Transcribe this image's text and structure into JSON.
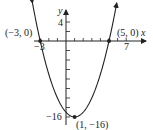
{
  "chart_data": {
    "type": "line",
    "title": "",
    "function": "y = (x + 3)(x - 5) = x^2 - 2x - 15... graph of parabola with vertex (1, -16)",
    "xlabel": "x",
    "ylabel": "y",
    "xlim": [
      -3.5,
      8
    ],
    "ylim": [
      -17.5,
      6
    ],
    "x_ticks_labeled": [
      -3,
      7
    ],
    "y_ticks_labeled": [
      4,
      -16
    ],
    "x_tick_step": 1,
    "y_tick_step": 2,
    "points": [
      {
        "label": "(-3, 0)",
        "x": -3,
        "y": 0
      },
      {
        "label": "(5, 0)",
        "x": 5,
        "y": 0
      },
      {
        "label": "(1, -16)",
        "x": 1,
        "y": -16
      }
    ],
    "series": [
      {
        "name": "parabola",
        "x": [
          -3.9,
          -3,
          -2,
          -1,
          0,
          1,
          2,
          3,
          4,
          5,
          5.9
        ],
        "y": [
          7.2,
          0,
          -7,
          -12,
          -15,
          -16,
          -15,
          -12,
          -7,
          0,
          7.2
        ]
      }
    ],
    "grid": false,
    "legend": null
  },
  "labels": {
    "x_axis": "x",
    "y_axis": "y",
    "tick_neg3": "−3",
    "tick_7": "7",
    "tick_4": "4",
    "tick_neg16": "−16",
    "pt_left": "(−3, 0)",
    "pt_right": "(5, 0)",
    "pt_vertex": "(1, −16)"
  }
}
